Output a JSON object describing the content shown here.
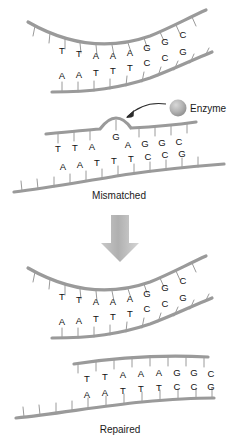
{
  "figure": {
    "background_color": "#ffffff",
    "strand_color": "#9a9a9a",
    "text_color": "#111111",
    "arrow_color": "#b5b5b5"
  },
  "panels": [
    {
      "id": "panel-normal-top",
      "caption": "",
      "top_strand_bases": [
        "T",
        "T",
        "A",
        "A",
        "A",
        "G",
        "G",
        "C"
      ],
      "bottom_strand_bases": [
        "A",
        "A",
        "T",
        "T",
        "T",
        "C",
        "C",
        "G"
      ]
    },
    {
      "id": "panel-mismatched",
      "caption": "Mismatched",
      "top_strand_bases": [
        "T",
        "T",
        "A",
        "G",
        "A",
        "G",
        "G",
        "C"
      ],
      "bottom_strand_bases": [
        "A",
        "A",
        "T",
        "T",
        "T",
        "C",
        "C",
        "G"
      ],
      "bulge_base": "G",
      "bulge_index": 3
    },
    {
      "id": "panel-normal-lower",
      "caption": "",
      "top_strand_bases": [
        "T",
        "T",
        "A",
        "A",
        "A",
        "G",
        "G",
        "C"
      ],
      "bottom_strand_bases": [
        "A",
        "A",
        "T",
        "T",
        "T",
        "C",
        "C",
        "G"
      ]
    },
    {
      "id": "panel-repaired",
      "caption": "Repaired",
      "top_strand_bases": [
        "T",
        "T",
        "A",
        "A",
        "A",
        "G",
        "G",
        "C"
      ],
      "bottom_strand_bases": [
        "A",
        "A",
        "T",
        "T",
        "T",
        "C",
        "C",
        "G"
      ]
    }
  ],
  "annotations": {
    "enzyme_label": "Enzyme",
    "mismatched_caption": "Mismatched",
    "repaired_caption": "Repaired",
    "process_arrow": "down-arrow"
  }
}
